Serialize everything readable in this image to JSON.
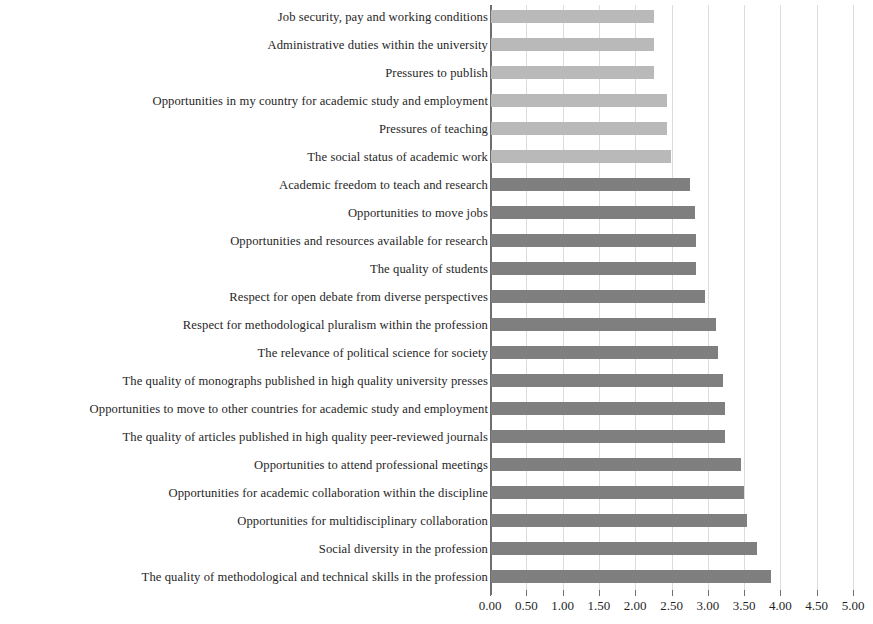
{
  "chart_data": {
    "type": "bar",
    "orientation": "horizontal",
    "title": "",
    "subtitle": "",
    "xlabel": "",
    "ylabel": "",
    "xlim": [
      0.0,
      5.0
    ],
    "xticks": [
      "0.00",
      "0.50",
      "1.00",
      "1.50",
      "2.00",
      "2.50",
      "3.00",
      "3.50",
      "4.00",
      "4.50",
      "5.00"
    ],
    "xtick_values": [
      0.0,
      0.5,
      1.0,
      1.5,
      2.0,
      2.5,
      3.0,
      3.5,
      4.0,
      4.5,
      5.0
    ],
    "grid": true,
    "grid_axis": "x",
    "legend": "none",
    "categories": [
      "Job security, pay and working conditions",
      "Administrative duties within the university",
      "Pressures to publish",
      "Opportunities in my country for academic study and employment",
      "Pressures of teaching",
      "The social status of academic work",
      "Academic freedom to teach and research",
      "Opportunities to move jobs",
      "Opportunities and resources available for research",
      "The quality of students",
      "Respect for open debate from diverse perspectives",
      "Respect for methodological pluralism within the profession",
      "The relevance of political science for society",
      "The quality of monographs published in high quality university presses",
      "Opportunities to move to other countries for academic study and employment",
      "The quality of articles published in high quality peer-reviewed journals",
      "Opportunities to attend professional meetings",
      "Opportunities for academic collaboration within the discipline",
      "Opportunities for multidisciplinary collaboration",
      "Social diversity in the profession",
      "The quality of methodological and technical skills in the profession"
    ],
    "values": [
      2.24,
      2.25,
      2.25,
      2.42,
      2.43,
      2.48,
      2.74,
      2.81,
      2.82,
      2.82,
      2.95,
      3.1,
      3.13,
      3.2,
      3.22,
      3.22,
      3.44,
      3.49,
      3.52,
      3.66,
      3.85
    ],
    "bar_shades": [
      "light",
      "light",
      "light",
      "light",
      "light",
      "light",
      "dark",
      "dark",
      "dark",
      "dark",
      "dark",
      "dark",
      "dark",
      "dark",
      "dark",
      "dark",
      "dark",
      "dark",
      "dark",
      "dark",
      "dark"
    ]
  },
  "colors": {
    "bar_light": "#b9b9b9",
    "bar_dark": "#7f7f7f",
    "gridline": "#dcdcdc",
    "axis": "#6e6e6e",
    "text": "#262626",
    "background": "#ffffff"
  }
}
